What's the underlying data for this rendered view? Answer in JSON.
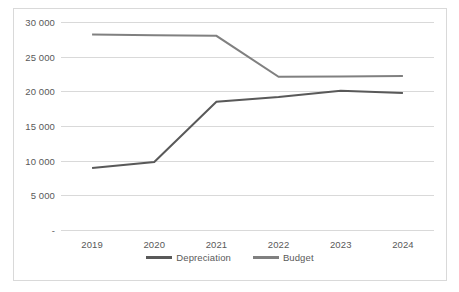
{
  "chart_data": {
    "type": "line",
    "title": "",
    "subtitle": "",
    "xlabel": "",
    "ylabel": "",
    "categories": [
      "2019",
      "2020",
      "2021",
      "2022",
      "2023",
      "2024"
    ],
    "series": [
      {
        "name": "Depreciation",
        "color": "#595959",
        "values": [
          8950,
          9800,
          18500,
          19200,
          20100,
          19750
        ]
      },
      {
        "name": "Budget",
        "color": "#808080",
        "values": [
          28200,
          28100,
          28000,
          22100,
          22150,
          22200
        ]
      }
    ],
    "ylim": [
      0,
      30000
    ],
    "ytick_values": [
      0,
      5000,
      10000,
      15000,
      20000,
      25000,
      30000
    ],
    "ytick_labels": [
      "-",
      "5 000",
      "10 000",
      "15 000",
      "20 000",
      "25 000",
      "30 000"
    ],
    "grid": true,
    "grid_axis": "y",
    "grid_color": "#d9d9d9",
    "legend_position": "bottom",
    "border_color": "#d9d9d9",
    "background": "#ffffff",
    "line_width": 2
  },
  "legend": {
    "entries": [
      {
        "label": "Depreciation"
      },
      {
        "label": "Budget"
      }
    ]
  }
}
